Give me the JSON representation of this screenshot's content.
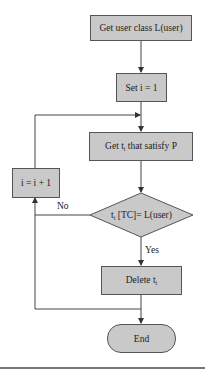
{
  "diagram": {
    "type": "flowchart",
    "nodes": {
      "start": {
        "label": "Get user class L(user)",
        "shape": "rectangle"
      },
      "init": {
        "label": "Set i = 1",
        "shape": "rectangle"
      },
      "get": {
        "label_main": "Get t",
        "label_sub": "i",
        "label_rest": " that satisfy P",
        "shape": "rectangle"
      },
      "decision": {
        "label_main": "t",
        "label_sub": "i",
        "label_rest": " [TC]= L(user)",
        "shape": "diamond"
      },
      "increment": {
        "label": "i = i + 1",
        "shape": "rectangle"
      },
      "delete": {
        "label_main": "Delete t",
        "label_sub": "i",
        "shape": "rectangle"
      },
      "end": {
        "label": "End",
        "shape": "terminal"
      }
    },
    "edges": {
      "no_label": "No",
      "yes_label": "Yes"
    },
    "colors": {
      "node_fill": "#c9c9c9",
      "node_border": "#555555",
      "line": "#444444"
    }
  }
}
